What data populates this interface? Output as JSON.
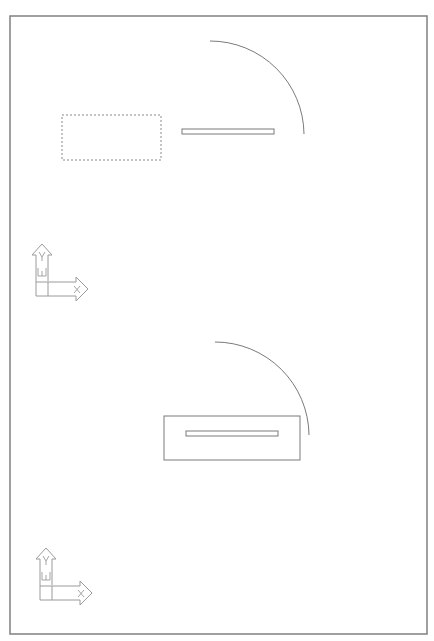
{
  "drawing": {
    "colors": {
      "background": "#ffffff",
      "frame": "#808080",
      "linework": "#7a7a7a",
      "ucs_icon": "#9a9a9a"
    },
    "frame": {
      "x": 10,
      "y": 16,
      "width": 417,
      "height": 618
    },
    "views": [
      {
        "name": "top-view",
        "dashed_rect": {
          "x": 62,
          "y": 115,
          "width": 99,
          "height": 45
        },
        "slot": {
          "x": 182,
          "y": 129,
          "width": 92,
          "height": 5
        },
        "door_swing_arc": {
          "start": [
            210,
            41
          ],
          "end": [
            304,
            134
          ],
          "radius": 94
        },
        "ucs_icon": {
          "x": 32,
          "y": 243,
          "labels": {
            "y_axis": "Y",
            "x_axis": "X",
            "world": "W"
          }
        }
      },
      {
        "name": "bottom-view",
        "solid_rect": {
          "x": 164,
          "y": 416,
          "width": 136,
          "height": 44
        },
        "slot": {
          "x": 186,
          "y": 431,
          "width": 92,
          "height": 5
        },
        "door_swing_arc": {
          "start": [
            215,
            342
          ],
          "end": [
            309,
            435
          ],
          "radius": 94
        },
        "ucs_icon": {
          "x": 36,
          "y": 547,
          "labels": {
            "y_axis": "Y",
            "x_axis": "X",
            "world": "W"
          }
        }
      }
    ]
  }
}
